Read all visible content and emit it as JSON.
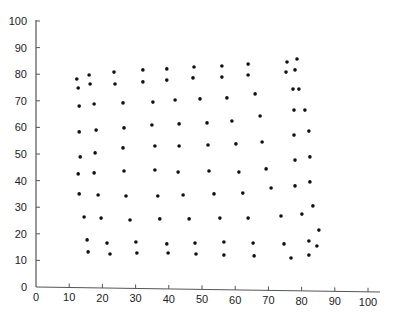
{
  "chart_data": {
    "type": "scatter",
    "title": "",
    "xlabel": "",
    "ylabel": "",
    "xlim": [
      0,
      100
    ],
    "ylim": [
      0,
      100
    ],
    "grid": false,
    "legend": null,
    "x_ticks": [
      0,
      10,
      20,
      30,
      40,
      50,
      60,
      70,
      80,
      90,
      100
    ],
    "y_ticks": [
      0,
      10,
      20,
      30,
      40,
      50,
      60,
      70,
      80,
      90,
      100
    ],
    "series": [
      {
        "name": "points",
        "color": "#111111",
        "points": [
          [
            12.3,
            78.2
          ],
          [
            12.7,
            74.8
          ],
          [
            13.0,
            68.0
          ],
          [
            13.0,
            58.3
          ],
          [
            13.3,
            48.9
          ],
          [
            12.7,
            42.5
          ],
          [
            13.0,
            35.0
          ],
          [
            14.5,
            26.3
          ],
          [
            15.4,
            17.7
          ],
          [
            15.7,
            13.2
          ],
          [
            16.0,
            79.7
          ],
          [
            16.3,
            76.3
          ],
          [
            17.5,
            68.8
          ],
          [
            18.1,
            59.0
          ],
          [
            17.8,
            50.4
          ],
          [
            17.5,
            42.9
          ],
          [
            18.7,
            34.6
          ],
          [
            19.6,
            25.9
          ],
          [
            21.4,
            16.5
          ],
          [
            22.3,
            12.4
          ],
          [
            23.5,
            80.8
          ],
          [
            23.8,
            76.3
          ],
          [
            26.2,
            69.2
          ],
          [
            26.5,
            59.8
          ],
          [
            26.2,
            52.3
          ],
          [
            26.5,
            43.6
          ],
          [
            27.1,
            34.2
          ],
          [
            28.3,
            25.2
          ],
          [
            30.1,
            16.9
          ],
          [
            30.4,
            12.8
          ],
          [
            32.2,
            81.6
          ],
          [
            32.2,
            77.1
          ],
          [
            35.2,
            69.5
          ],
          [
            34.9,
            60.9
          ],
          [
            35.8,
            53.0
          ],
          [
            35.8,
            44.0
          ],
          [
            36.7,
            34.2
          ],
          [
            37.3,
            25.6
          ],
          [
            39.4,
            16.2
          ],
          [
            39.8,
            12.8
          ],
          [
            39.4,
            82.0
          ],
          [
            39.4,
            77.8
          ],
          [
            41.9,
            70.3
          ],
          [
            43.1,
            61.3
          ],
          [
            43.1,
            53.0
          ],
          [
            42.8,
            43.2
          ],
          [
            44.3,
            34.6
          ],
          [
            46.1,
            25.6
          ],
          [
            47.9,
            16.5
          ],
          [
            48.2,
            12.4
          ],
          [
            47.6,
            82.7
          ],
          [
            47.3,
            78.6
          ],
          [
            49.4,
            70.7
          ],
          [
            51.5,
            61.7
          ],
          [
            51.8,
            53.4
          ],
          [
            52.1,
            43.6
          ],
          [
            53.6,
            35.0
          ],
          [
            55.4,
            25.9
          ],
          [
            56.6,
            16.9
          ],
          [
            56.6,
            12.0
          ],
          [
            56.0,
            83.1
          ],
          [
            56.0,
            78.9
          ],
          [
            57.5,
            71.1
          ],
          [
            59.0,
            62.4
          ],
          [
            60.2,
            53.8
          ],
          [
            61.1,
            43.2
          ],
          [
            62.3,
            35.3
          ],
          [
            63.9,
            25.9
          ],
          [
            65.4,
            16.5
          ],
          [
            65.7,
            11.7
          ],
          [
            63.9,
            83.8
          ],
          [
            63.9,
            79.7
          ],
          [
            66.0,
            72.6
          ],
          [
            67.5,
            64.3
          ],
          [
            68.1,
            54.5
          ],
          [
            69.3,
            44.4
          ],
          [
            70.8,
            37.2
          ],
          [
            73.8,
            26.7
          ],
          [
            74.7,
            16.2
          ],
          [
            76.8,
            10.9
          ],
          [
            75.6,
            84.6
          ],
          [
            75.3,
            80.8
          ],
          [
            77.4,
            74.4
          ],
          [
            77.7,
            66.5
          ],
          [
            77.7,
            57.1
          ],
          [
            78.0,
            47.7
          ],
          [
            78.0,
            38.0
          ],
          [
            80.1,
            27.4
          ],
          [
            82.2,
            17.3
          ],
          [
            82.2,
            12.0
          ],
          [
            78.6,
            85.7
          ],
          [
            78.0,
            81.6
          ],
          [
            79.2,
            74.4
          ],
          [
            81.0,
            66.5
          ],
          [
            82.2,
            58.6
          ],
          [
            82.5,
            48.9
          ],
          [
            82.5,
            39.5
          ],
          [
            83.4,
            30.5
          ],
          [
            85.2,
            21.4
          ],
          [
            84.6,
            15.4
          ]
        ]
      }
    ]
  }
}
